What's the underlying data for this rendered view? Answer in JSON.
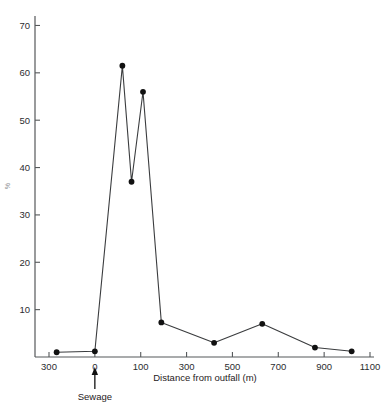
{
  "chart_data": {
    "type": "line",
    "title": "",
    "subtitle": "",
    "xlabel": "Distance from outfall (m)",
    "ylabel": "%",
    "x_tick_labels": [
      "300",
      "0",
      "100",
      "300",
      "500",
      "700",
      "900",
      "1100"
    ],
    "x_tick_values": [
      -300,
      0,
      100,
      300,
      500,
      700,
      900,
      1100
    ],
    "x_axis_note": "ticks evenly spaced; first tick is upstream (-300)",
    "y_tick_labels": [
      "10",
      "20",
      "30",
      "40",
      "50",
      "60",
      "70"
    ],
    "y_tick_values": [
      10,
      20,
      30,
      40,
      50,
      60,
      70
    ],
    "ylim": [
      0,
      72
    ],
    "grid": false,
    "legend": null,
    "marker": "filled-circle",
    "x": [
      -250,
      0,
      60,
      80,
      110,
      190,
      420,
      630,
      860,
      1020
    ],
    "values": [
      1.0,
      1.2,
      61.5,
      37.0,
      56.0,
      7.3,
      3.0,
      7.0,
      2.0,
      1.2
    ],
    "points": [
      {
        "x": -250,
        "y": 1.0
      },
      {
        "x": 0,
        "y": 1.2
      },
      {
        "x": 60,
        "y": 61.5
      },
      {
        "x": 80,
        "y": 37.0
      },
      {
        "x": 110,
        "y": 56.0
      },
      {
        "x": 190,
        "y": 7.3
      },
      {
        "x": 420,
        "y": 3.0
      },
      {
        "x": 630,
        "y": 7.0
      },
      {
        "x": 860,
        "y": 2.0
      },
      {
        "x": 1020,
        "y": 1.2
      }
    ],
    "annotations": [
      {
        "label": "Sewage",
        "x": 0,
        "type": "up-arrow-below-axis"
      }
    ]
  },
  "axis": {
    "x_title": "Distance from outfall (m)",
    "y_title": "%"
  },
  "annotation": {
    "sewage_label": "Sewage"
  },
  "colors": {
    "line": "#3a3c3e",
    "marker": "#111111",
    "axis": "#55585a",
    "text": "#1f2123",
    "background": "#ffffff"
  }
}
